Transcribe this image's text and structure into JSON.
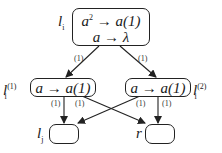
{
  "diagram": {
    "nodes": [
      {
        "id": "li",
        "label_base": "l",
        "label_sub": "i",
        "label_sup": "",
        "rules": [
          {
            "lhs": "a",
            "lhs_sup": "2",
            "arrow": "→",
            "rhs": "a(1)"
          },
          {
            "lhs": "a",
            "lhs_sup": "",
            "arrow": "→",
            "rhs": "λ"
          }
        ]
      },
      {
        "id": "li1",
        "label_base": "l",
        "label_sub": "i",
        "label_sup": "(1)",
        "rules": [
          {
            "lhs": "a",
            "lhs_sup": "",
            "arrow": "→",
            "rhs": "a(1)"
          }
        ]
      },
      {
        "id": "li2",
        "label_base": "l",
        "label_sub": "i",
        "label_sup": "(2)",
        "rules": [
          {
            "lhs": "a",
            "lhs_sup": "",
            "arrow": "→",
            "rhs": "a(1)"
          }
        ]
      },
      {
        "id": "lj",
        "label_base": "l",
        "label_sub": "j",
        "label_sup": "",
        "rules": []
      },
      {
        "id": "r",
        "label_base": "r",
        "label_sub": "",
        "label_sup": "",
        "rules": []
      }
    ],
    "edges": [
      {
        "from": "li",
        "to": "li1",
        "weight": "(1)"
      },
      {
        "from": "li",
        "to": "li2",
        "weight": "(1)"
      },
      {
        "from": "li1",
        "to": "lj",
        "weight": "(1)"
      },
      {
        "from": "li1",
        "to": "r",
        "weight": "(1)"
      },
      {
        "from": "li2",
        "to": "lj",
        "weight": "(1)"
      },
      {
        "from": "li2",
        "to": "r",
        "weight": "(1)"
      }
    ]
  }
}
